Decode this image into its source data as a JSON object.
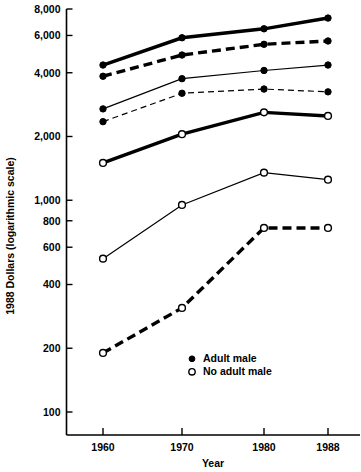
{
  "chart_data": {
    "type": "line",
    "title": "",
    "xlabel": "Year",
    "ylabel": "1988 Dollars (logarithmic scale)",
    "x": [
      1960,
      1970,
      1980,
      1988
    ],
    "xtick_labels": [
      "1960",
      "1970",
      "1980",
      "1988"
    ],
    "ytick_values": [
      8000,
      6000,
      4000,
      2000,
      1000,
      800,
      600,
      400,
      200,
      100
    ],
    "ytick_labels": [
      "8,000",
      "6,000",
      "4,000",
      "2,000",
      "1,000",
      "800",
      "600",
      "400",
      "200",
      "100"
    ],
    "ylim": [
      100,
      8000
    ],
    "yscale": "log",
    "grid": false,
    "legend_position": "inside-bottom-center",
    "series": [
      {
        "name": "series-1-adult-male-thick-solid",
        "marker": "filled",
        "linestyle": "solid",
        "linewidth": 3.4,
        "values": [
          4350,
          5850,
          6450,
          7250
        ]
      },
      {
        "name": "series-2-adult-male-thick-dashed",
        "marker": "filled",
        "linestyle": "dashed",
        "linewidth": 3.4,
        "values": [
          3850,
          4850,
          5450,
          5650
        ]
      },
      {
        "name": "series-3-adult-male-thin-solid",
        "marker": "filled",
        "linestyle": "solid",
        "linewidth": 1.2,
        "values": [
          2700,
          3750,
          4100,
          4350
        ]
      },
      {
        "name": "series-4-adult-male-thin-dashed",
        "marker": "filled",
        "linestyle": "dashed",
        "linewidth": 1.2,
        "values": [
          2350,
          3200,
          3350,
          3250
        ]
      },
      {
        "name": "series-5-no-adult-male-thick-solid",
        "marker": "open",
        "linestyle": "solid",
        "linewidth": 3.4,
        "values": [
          1500,
          2050,
          2600,
          2500
        ]
      },
      {
        "name": "series-6-no-adult-male-thin-solid",
        "marker": "open",
        "linestyle": "solid",
        "linewidth": 1.2,
        "values": [
          530,
          950,
          1350,
          1250
        ]
      },
      {
        "name": "series-7-no-adult-male-thick-dashed",
        "marker": "open",
        "linestyle": "dashed",
        "linewidth": 3.4,
        "values": [
          190,
          310,
          740,
          740
        ]
      }
    ],
    "legend": [
      {
        "label": "Adult male",
        "marker": "filled"
      },
      {
        "label": "No adult male",
        "marker": "open"
      }
    ]
  }
}
